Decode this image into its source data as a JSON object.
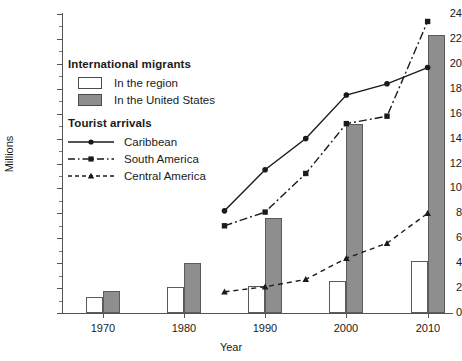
{
  "chart_data": {
    "type": "bar",
    "title": "",
    "xlabel": "Year",
    "ylabel": "Millions",
    "categories": [
      "1970",
      "1980",
      "1990",
      "2000",
      "2010"
    ],
    "xlim": [
      1965,
      2013
    ],
    "ylim": [
      0,
      24
    ],
    "y_ticks": [
      0,
      2,
      4,
      6,
      8,
      10,
      12,
      14,
      16,
      18,
      20,
      22,
      24
    ],
    "grid": false,
    "legend_position": "upper-left-inside",
    "bar_series": [
      {
        "name": "In the region",
        "group": "International migrants",
        "color": "#ffffff",
        "edge": "#5b5b5b",
        "values": [
          1.3,
          2.1,
          2.2,
          2.6,
          4.2
        ]
      },
      {
        "name": "In the United States",
        "group": "International migrants",
        "color": "#8e8e8e",
        "edge": "#5b5b5b",
        "values": [
          1.8,
          4.0,
          7.6,
          15.2,
          22.3
        ]
      }
    ],
    "line_series": [
      {
        "name": "Caribbean",
        "group": "Tourist arrivals",
        "style": "solid",
        "marker": "circle",
        "x": [
          1985,
          1990,
          1995,
          2000,
          2005,
          2010
        ],
        "values": [
          8.2,
          11.5,
          14.0,
          17.5,
          18.4,
          19.7
        ]
      },
      {
        "name": "South America",
        "group": "Tourist arrivals",
        "style": "dash-dot",
        "marker": "square",
        "x": [
          1985,
          1990,
          1995,
          2000,
          2005,
          2010
        ],
        "values": [
          7.0,
          8.1,
          11.2,
          15.2,
          15.8,
          23.4
        ]
      },
      {
        "name": "Central America",
        "group": "Tourist arrivals",
        "style": "dashed",
        "marker": "triangle",
        "x": [
          1985,
          1990,
          1995,
          2000,
          2005,
          2010
        ],
        "values": [
          1.7,
          2.1,
          2.7,
          4.4,
          5.6,
          8.0
        ]
      }
    ]
  },
  "legend": {
    "migrants_title": "International migrants",
    "migrants_items": [
      {
        "label": "In the region",
        "swatch": "region"
      },
      {
        "label": "In the United States",
        "swatch": "usa"
      }
    ],
    "tourist_title": "Tourist arrivals",
    "tourist_items": [
      {
        "label": "Caribbean"
      },
      {
        "label": "South America"
      },
      {
        "label": "Central America"
      }
    ]
  }
}
